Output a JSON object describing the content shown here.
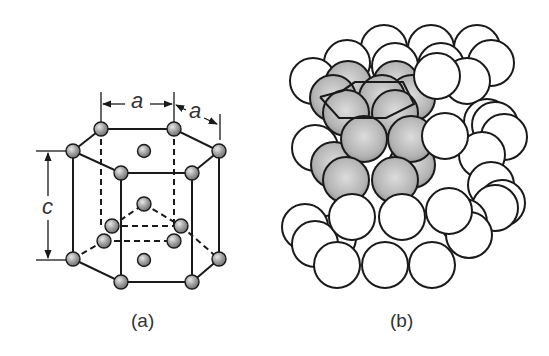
{
  "figure": {
    "panels": [
      {
        "id": "a",
        "caption": "(a)",
        "description": "HCP unit cell ball-and-stick",
        "dimensions": {
          "a_label": "a",
          "a2_label": "a",
          "c_label": "c"
        }
      },
      {
        "id": "b",
        "caption": "(b)",
        "description": "HCP close-packed sphere stacking with highlighted unit cell"
      }
    ],
    "colors": {
      "line": "#1a1a1a",
      "atom_fill": "#9a9a9a",
      "sphere_highlight": "#c8c8c8",
      "sphere_white": "#ffffff",
      "text": "#333333"
    }
  }
}
